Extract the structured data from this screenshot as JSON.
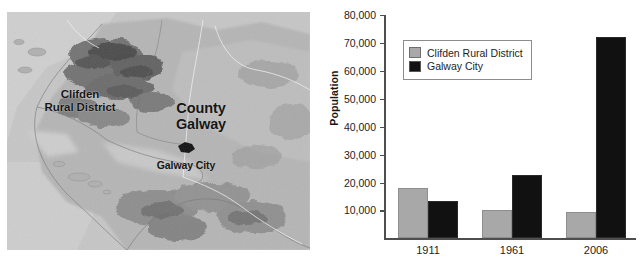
{
  "map": {
    "name": "county-galway-terrain-map",
    "labels": [
      {
        "id": "clifden",
        "text": "Clifden\nRural District"
      },
      {
        "id": "county",
        "text": "County\nGalway"
      },
      {
        "id": "city",
        "text": "Galway City"
      }
    ],
    "city_marker": "galway-city-marker"
  },
  "chart_data": {
    "type": "bar",
    "title": "",
    "xlabel": "",
    "ylabel": "Population",
    "categories": [
      "1911",
      "1961",
      "2006"
    ],
    "series": [
      {
        "name": "Clifden Rural District",
        "color": "#a8a8a8",
        "values": [
          18000,
          10000,
          9500
        ]
      },
      {
        "name": "Galway City",
        "color": "#111111",
        "values": [
          13500,
          22700,
          72000
        ]
      }
    ],
    "ylim": [
      0,
      80000
    ],
    "ytick_values": [
      10000,
      20000,
      30000,
      40000,
      50000,
      60000,
      70000,
      80000
    ],
    "ytick_labels": [
      "10,000",
      "20,000",
      "30,000",
      "40,000",
      "50,000",
      "60,000",
      "70,000",
      "80,000"
    ],
    "grid": false,
    "legend_position": "upper left"
  }
}
